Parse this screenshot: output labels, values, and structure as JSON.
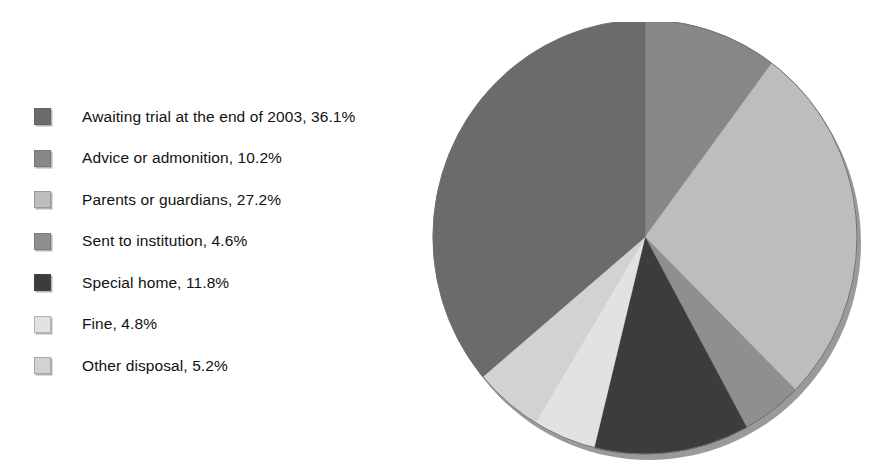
{
  "chart_data": {
    "type": "pie",
    "title": "",
    "subtitle": "",
    "xlabel": "",
    "ylabel": "",
    "grid": false,
    "legend_position": "left",
    "units": "%",
    "start_angle_deg": 0,
    "direction": "clockwise",
    "categories": [
      "Awaiting trial at the end of 2003",
      "Advice or admonition",
      "Parents or guardians",
      "Sent to institution",
      "Special home",
      "Fine",
      "Other disposal"
    ],
    "values": [
      36.1,
      10.2,
      27.2,
      4.6,
      11.8,
      4.8,
      5.2
    ],
    "labels": [
      "Awaiting trial at the end of 2003, 36.1%",
      "Advice or admonition, 10.2%",
      "Parents or guardians, 27.2%",
      "Sent to institution, 4.6%",
      "Special home, 11.8%",
      "Fine, 4.8%",
      "Other disposal, 5.2%"
    ],
    "colors": [
      "#6b6b6b",
      "#878787",
      "#bdbdbd",
      "#8f8f8f",
      "#3c3c3c",
      "#e2e2e2",
      "#d2d2d2"
    ],
    "slice_order_clockwise_from_top": [
      "Advice or admonition",
      "Parents or guardians",
      "Sent to institution",
      "Special home",
      "Fine",
      "Other disposal",
      "Awaiting trial at the end of 2003"
    ]
  },
  "legend": {
    "items": [
      {
        "label": "Awaiting trial at the end of 2003, 36.1%",
        "color": "#6b6b6b",
        "swatch_name": "legend-swatch-awaiting-trial"
      },
      {
        "label": "Advice or admonition, 10.2%",
        "color": "#878787",
        "swatch_name": "legend-swatch-advice"
      },
      {
        "label": "Parents or guardians, 27.2%",
        "color": "#bdbdbd",
        "swatch_name": "legend-swatch-parents"
      },
      {
        "label": "Sent to institution, 4.6%",
        "color": "#8f8f8f",
        "swatch_name": "legend-swatch-institution"
      },
      {
        "label": "Special home, 11.8%",
        "color": "#3c3c3c",
        "swatch_name": "legend-swatch-special-home"
      },
      {
        "label": "Fine, 4.8%",
        "color": "#e2e2e2",
        "swatch_name": "legend-swatch-fine"
      },
      {
        "label": "Other disposal, 5.2%",
        "color": "#d2d2d2",
        "swatch_name": "legend-swatch-other"
      }
    ]
  },
  "pie_geometry": {
    "center_x": 214,
    "center_y": 215,
    "radius_x": 212,
    "radius_y": 217,
    "shadow_color": "#9a9a9a",
    "edge_color": "#6f6f6f"
  }
}
